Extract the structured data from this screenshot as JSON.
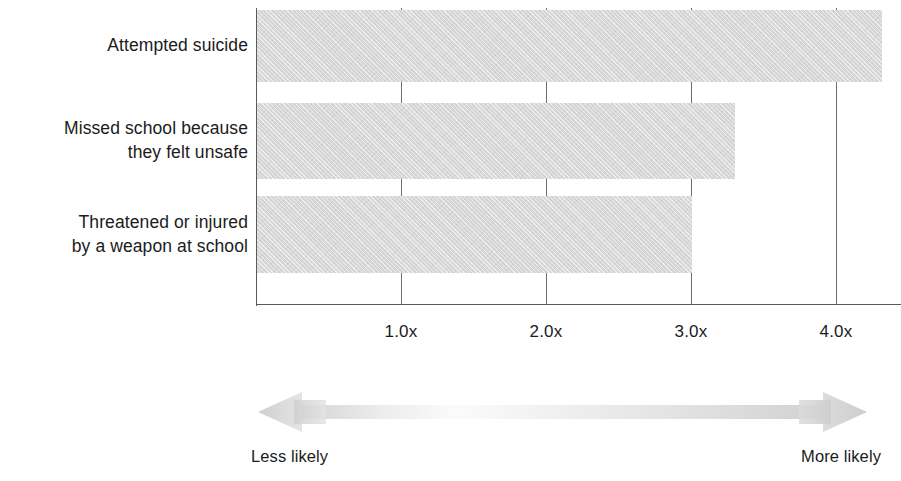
{
  "chart_data": {
    "type": "bar",
    "orientation": "horizontal",
    "title": "",
    "subtitle": "",
    "xlabel": "",
    "ylabel": "",
    "categories": [
      "Attempted suicide",
      "Missed school because\nthey felt unsafe",
      "Threatened or injured\nby a weapon at school"
    ],
    "values": [
      4.32,
      3.3,
      3.01
    ],
    "value_unit": "x",
    "xlim": [
      0,
      4.45
    ],
    "xticks": [
      1.0,
      2.0,
      3.0,
      4.0
    ],
    "xtick_labels": [
      "1.0x",
      "2.0x",
      "3.0x",
      "4.0x"
    ],
    "grid": "vertical-gridlines-behind-bars",
    "legend": "none",
    "bar_color": "#d7d7d7",
    "axis_color": "#5a5a5a",
    "text_color": "#1b1b1b",
    "annotations": {
      "arrow": "double-headed-horizontal-gradient-arrow",
      "left_caption": "Less likely",
      "right_caption": "More likely"
    }
  },
  "axis": {
    "ticks": [
      {
        "label": "1.0x",
        "value": 1.0
      },
      {
        "label": "2.0x",
        "value": 2.0
      },
      {
        "label": "3.0x",
        "value": 3.0
      },
      {
        "label": "4.0x",
        "value": 4.0
      }
    ]
  },
  "bars": [
    {
      "label": "Attempted suicide",
      "value": 4.32
    },
    {
      "label": "Missed school because\nthey felt unsafe",
      "value": 3.3
    },
    {
      "label": "Threatened or injured\nby a weapon at school",
      "value": 3.01
    }
  ],
  "footer": {
    "less_likely": "Less likely",
    "more_likely": "More likely"
  }
}
